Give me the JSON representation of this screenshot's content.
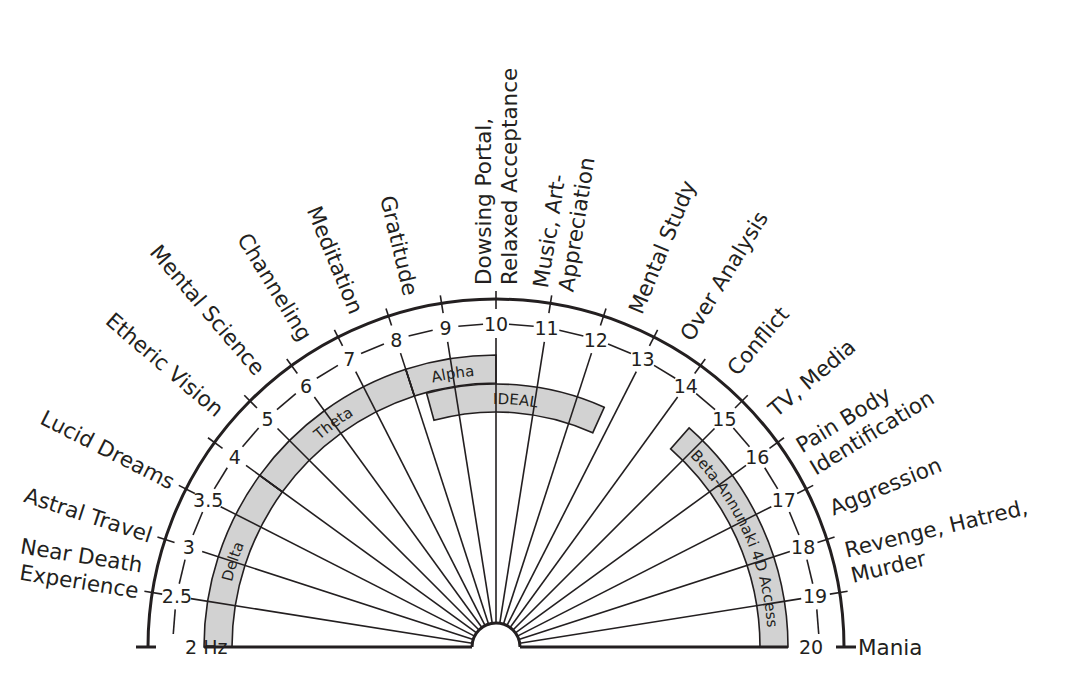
{
  "diagram": {
    "type": "semicircular-frequency-chart",
    "center_hub": "semicircle",
    "colors": {
      "ink": "#231f20",
      "band_fill": "#d2d2d2",
      "background": "#ffffff"
    },
    "scale": {
      "unit_label": "2 Hz",
      "ticks": [
        {
          "value": 2,
          "label": "2 Hz"
        },
        {
          "value": 2.5,
          "label": "2.5"
        },
        {
          "value": 3,
          "label": "3"
        },
        {
          "value": 3.5,
          "label": "3.5"
        },
        {
          "value": 4,
          "label": "4"
        },
        {
          "value": 5,
          "label": "5"
        },
        {
          "value": 6,
          "label": "6"
        },
        {
          "value": 7,
          "label": "7"
        },
        {
          "value": 8,
          "label": "8"
        },
        {
          "value": 9,
          "label": "9"
        },
        {
          "value": 10,
          "label": "10"
        },
        {
          "value": 11,
          "label": "11"
        },
        {
          "value": 12,
          "label": "12"
        },
        {
          "value": 13,
          "label": "13"
        },
        {
          "value": 14,
          "label": "14"
        },
        {
          "value": 15,
          "label": "15"
        },
        {
          "value": 16,
          "label": "16"
        },
        {
          "value": 17,
          "label": "17"
        },
        {
          "value": 18,
          "label": "18"
        },
        {
          "value": 19,
          "label": "19"
        },
        {
          "value": 20,
          "label": "20"
        }
      ]
    },
    "bands": [
      {
        "name": "Delta",
        "from": 2,
        "to": 4
      },
      {
        "name": "Theta",
        "from": 4,
        "to": 8
      },
      {
        "name": "Alpha",
        "from": 8,
        "to": 10
      },
      {
        "name": "IDEAL",
        "from": 8.3,
        "to": 12.7
      },
      {
        "name": "Beta-Annunaki 4D Access",
        "from": 14.6,
        "to": 20
      }
    ],
    "states": [
      {
        "at": 2.5,
        "lines": [
          "Near Death",
          "Experience"
        ]
      },
      {
        "at": 3,
        "lines": [
          "Astral Travel"
        ]
      },
      {
        "at": 3.5,
        "lines": [
          "Lucid Dreams"
        ]
      },
      {
        "at": 4.5,
        "lines": [
          "Etheric Vision"
        ]
      },
      {
        "at": 5.5,
        "lines": [
          "Mental Science"
        ]
      },
      {
        "at": 6.5,
        "lines": [
          "Channeling"
        ]
      },
      {
        "at": 7.5,
        "lines": [
          "Meditation"
        ]
      },
      {
        "at": 8.5,
        "lines": [
          "Gratitude"
        ]
      },
      {
        "at": 10,
        "lines": [
          "Dowsing Portal,",
          "Relaxed Acceptance"
        ]
      },
      {
        "at": 11,
        "lines": [
          "Music, Art-",
          "Appreciation"
        ]
      },
      {
        "at": 12.5,
        "lines": [
          "Mental Study"
        ]
      },
      {
        "at": 13.5,
        "lines": [
          "Over Analysis"
        ]
      },
      {
        "at": 14.5,
        "lines": [
          "Conflict"
        ]
      },
      {
        "at": 15.5,
        "lines": [
          "TV, Media"
        ]
      },
      {
        "at": 16.5,
        "lines": [
          "Pain Body",
          "Identification"
        ]
      },
      {
        "at": 17.5,
        "lines": [
          "Aggression"
        ]
      },
      {
        "at": 18.5,
        "lines": [
          "Revenge, Hatred,",
          "Murder"
        ]
      },
      {
        "at": 20,
        "lines": [
          "Mania"
        ]
      }
    ]
  }
}
